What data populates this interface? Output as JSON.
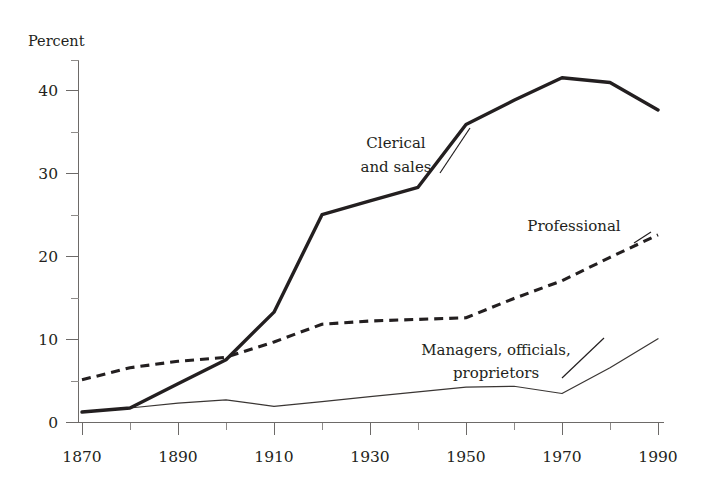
{
  "chart_data": {
    "type": "line",
    "title": "",
    "subtitle": "",
    "xlabel": "",
    "ylabel": "Percent",
    "ylabel_position": "top-left",
    "x": [
      1870,
      1880,
      1890,
      1900,
      1910,
      1920,
      1930,
      1940,
      1950,
      1960,
      1970,
      1980,
      1990
    ],
    "xlim": [
      1870,
      1990
    ],
    "ylim": [
      0,
      45
    ],
    "xticks": [
      1870,
      1880,
      1890,
      1900,
      1910,
      1920,
      1930,
      1940,
      1950,
      1960,
      1970,
      1980,
      1990
    ],
    "xtick_labels": [
      "1870",
      "",
      "1890",
      "",
      "1910",
      "",
      "1930",
      "",
      "1950",
      "",
      "1970",
      "",
      "1990"
    ],
    "xtick_labels_shown": [
      "1870",
      "1890",
      "1910",
      "1930",
      "1950",
      "1970",
      "1990"
    ],
    "yticks_major": [
      0,
      10,
      20,
      30,
      40
    ],
    "ytick_labels": [
      "0",
      "10",
      "20",
      "30",
      "40"
    ],
    "yticks_minor": [
      5,
      15,
      25,
      35,
      45
    ],
    "grid": false,
    "legend": "inline-annotations",
    "legend_position": "inline",
    "series": [
      {
        "name": "Clerical and sales",
        "style": "thick-solid",
        "color": "#231f20",
        "values": [
          1.3,
          1.8,
          4.8,
          7.8,
          13.7,
          25.8,
          27.5,
          29.2,
          37.0,
          40.0,
          42.8,
          42.2,
          38.8
        ]
      },
      {
        "name": "Professional",
        "style": "dashed",
        "color": "#231f20",
        "values": [
          5.3,
          6.8,
          7.6,
          8.1,
          10.0,
          12.2,
          12.6,
          12.8,
          13.0,
          15.4,
          17.6,
          20.5,
          23.3
        ]
      },
      {
        "name": "Managers, officials, proprietors",
        "style": "thin-solid",
        "color": "#3a3634",
        "values": [
          1.3,
          1.8,
          2.4,
          2.8,
          2.0,
          2.6,
          3.2,
          3.8,
          4.4,
          4.5,
          3.6,
          6.8,
          10.4
        ]
      }
    ],
    "annotations": [
      {
        "id": "clerical",
        "lines": [
          "Clerical",
          "and sales"
        ],
        "target_series": "Clerical and sales"
      },
      {
        "id": "professional",
        "lines": [
          "Professional"
        ],
        "target_series": "Professional"
      },
      {
        "id": "managers",
        "lines": [
          "Managers, officials,",
          "proprietors"
        ],
        "target_series": "Managers, officials, proprietors"
      }
    ]
  },
  "axis": {
    "y_title": "Percent",
    "y_labels": {
      "t0": "0",
      "t10": "10",
      "t20": "20",
      "t30": "30",
      "t40": "40"
    },
    "x_labels": {
      "t1870": "1870",
      "t1890": "1890",
      "t1910": "1910",
      "t1930": "1930",
      "t1950": "1950",
      "t1970": "1970",
      "t1990": "1990"
    }
  },
  "annotations": {
    "clerical_line1": "Clerical",
    "clerical_line2": "and sales",
    "professional_line1": "Professional",
    "managers_line1": "Managers, officials,",
    "managers_line2": "proprietors"
  },
  "colors": {
    "ink": "#231f20",
    "axis": "#6d6a68",
    "thin_series": "#3a3634",
    "background": "#ffffff"
  }
}
